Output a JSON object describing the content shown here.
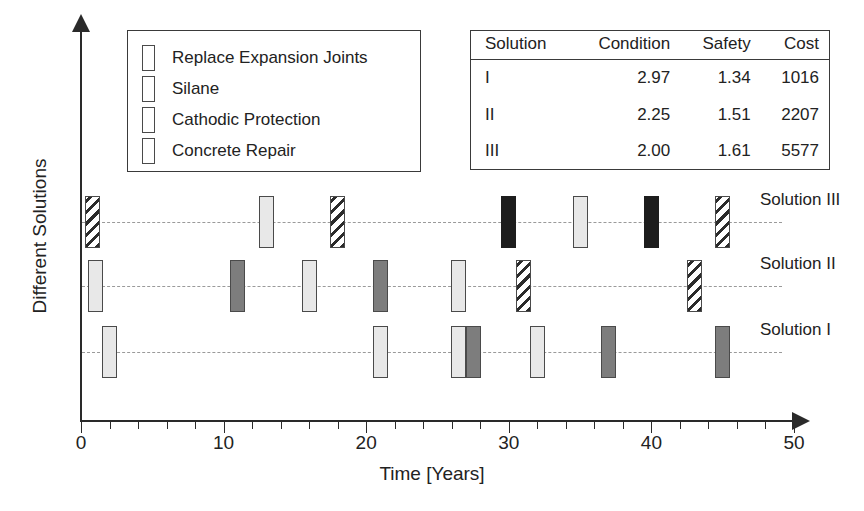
{
  "chart_data": {
    "type": "timeline",
    "title": "",
    "xlabel": "Time [Years]",
    "ylabel": "Different Solutions",
    "xlim": [
      0,
      50
    ],
    "xticks_major": [
      0,
      10,
      20,
      30,
      40,
      50
    ],
    "xtick_labels": [
      "0",
      "10",
      "20",
      "30",
      "40",
      "50"
    ],
    "xtick_interval_minor": 2,
    "grid": "dashed horizontal row lines",
    "legend_position": "upper-left inside plot",
    "legend": [
      {
        "key": "replace",
        "label": "Replace Expansion Joints",
        "fill": "#e8e8e8"
      },
      {
        "key": "silane",
        "label": "Silane",
        "fill": "#7d7d7d"
      },
      {
        "key": "cathodic",
        "label": "Cathodic Protection",
        "fill": "diagonal-hatch"
      },
      {
        "key": "concrete",
        "label": "Concrete Repair",
        "fill": "#1d1d1d"
      }
    ],
    "rows": [
      {
        "label": "Solution III",
        "events": [
          {
            "year": 0.8,
            "type": "cathodic"
          },
          {
            "year": 13.0,
            "type": "replace"
          },
          {
            "year": 18.0,
            "type": "cathodic"
          },
          {
            "year": 30.0,
            "type": "concrete"
          },
          {
            "year": 35.0,
            "type": "replace"
          },
          {
            "year": 40.0,
            "type": "concrete"
          },
          {
            "year": 45.0,
            "type": "cathodic"
          }
        ]
      },
      {
        "label": "Solution II",
        "events": [
          {
            "year": 1.0,
            "type": "replace"
          },
          {
            "year": 11.0,
            "type": "silane"
          },
          {
            "year": 16.0,
            "type": "replace"
          },
          {
            "year": 21.0,
            "type": "silane"
          },
          {
            "year": 26.5,
            "type": "replace"
          },
          {
            "year": 31.0,
            "type": "cathodic"
          },
          {
            "year": 43.0,
            "type": "cathodic"
          }
        ]
      },
      {
        "label": "Solution I",
        "events": [
          {
            "year": 2.0,
            "type": "replace"
          },
          {
            "year": 21.0,
            "type": "replace"
          },
          {
            "year": 26.5,
            "type": "replace"
          },
          {
            "year": 27.5,
            "type": "silane"
          },
          {
            "year": 32.0,
            "type": "replace"
          },
          {
            "year": 37.0,
            "type": "silane"
          },
          {
            "year": 45.0,
            "type": "silane"
          }
        ]
      }
    ]
  },
  "table": {
    "headers": [
      "Solution",
      "Condition",
      "Safety",
      "Cost"
    ],
    "rows": [
      [
        "I",
        "2.97",
        "1.34",
        "1016"
      ],
      [
        "II",
        "2.25",
        "1.51",
        "2207"
      ],
      [
        "III",
        "2.00",
        "1.61",
        "5577"
      ]
    ]
  },
  "caption": ""
}
